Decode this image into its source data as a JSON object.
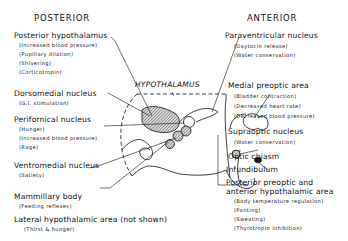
{
  "headers": {
    "posterior": "POSTERIOR",
    "anterior": "ANTERIOR"
  },
  "center_label": "HYPOTHALAMUS",
  "left_labels": [
    {
      "name": "Posterior hypothalamus",
      "functions": [
        "(Increased blood pressure)",
        "(Pupillary dilation)",
        "(Shivering)",
        "(Corticotropin)"
      ]
    },
    {
      "name": "Dorsomedial nucleus",
      "functions": [
        "(G.I. stimulation)"
      ]
    },
    {
      "name": "Perifornical nucleus",
      "functions": [
        "(Hunger)",
        "(Increased blood pressure)",
        "(Rage)"
      ]
    },
    {
      "name": "Ventromedial nucleus",
      "functions": [
        "(Satiety)"
      ]
    },
    {
      "name": "Mammillary body",
      "functions": [
        "(Feeding reflexes)"
      ]
    },
    {
      "name": "Lateral hypothalamic area (not shown)",
      "functions": [
        "(Thirst & hunger)"
      ]
    }
  ],
  "right_labels": [
    {
      "name": "Paraventricular nucleus",
      "functions": [
        "(Oxytocin release)",
        "(Water conservation)"
      ]
    },
    {
      "name": "Medial preoptic area",
      "functions": [
        "(Bladder contraction)",
        "(Decreased heart rate)",
        "(Decreased blood pressure)"
      ]
    },
    {
      "name": "Supraoptic nucleus",
      "functions": [
        "(Water conservation)"
      ]
    },
    {
      "name": "Optic chiasm",
      "functions": []
    },
    {
      "name": "Infundibulum",
      "functions": []
    },
    {
      "name": "Posterior preoptic and",
      "name_line2": "anterior hypothalamic area",
      "functions": [
        "(Body temperature regulation)",
        "(Panting)",
        "(Sweating)",
        "(Thyrotropin inhibition)"
      ]
    }
  ]
}
